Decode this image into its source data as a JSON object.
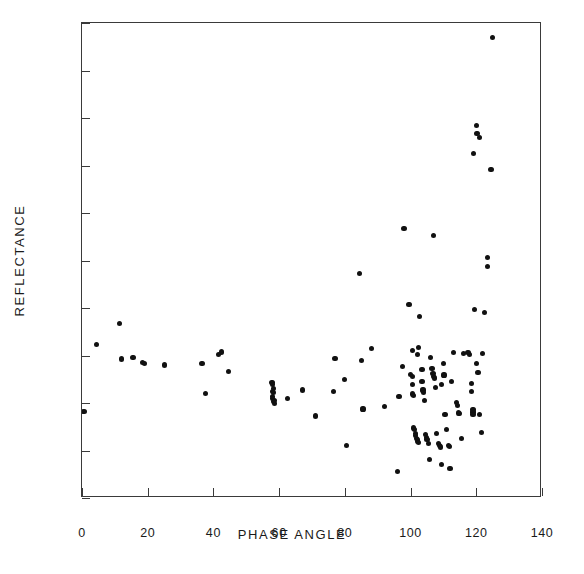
{
  "figure": {
    "background_color": "#ffffff",
    "frame_color": "#3a3a3a",
    "point_color": "#111111"
  },
  "chart_data": {
    "type": "scatter",
    "title": "",
    "xlabel": "PHASE ANGLE",
    "ylabel": "REFLECTANCE",
    "xlim": [
      0,
      140
    ],
    "ylim": [
      0,
      0.2
    ],
    "xticks": [
      0,
      20,
      40,
      60,
      80,
      100,
      120,
      140
    ],
    "xtick_labels": [
      "0",
      "20",
      "40",
      "60",
      "80",
      "100",
      "120",
      "140"
    ],
    "yticks": [
      0,
      0.02,
      0.04,
      0.06,
      0.08,
      0.1,
      0.12,
      0.14,
      0.16,
      0.18,
      0.2
    ],
    "ytick_labels": [
      "0",
      "0.02",
      "0.04",
      "0.06",
      "0.08",
      "0.10",
      "0.12",
      "0.14",
      "0.16",
      "0.18",
      "0.20"
    ],
    "grid": false,
    "legend": null,
    "marker": "filled-circle",
    "series": [
      {
        "name": "observations",
        "points": [
          [
            0.6,
            0.0365
          ],
          [
            4.5,
            0.0645
          ],
          [
            11.5,
            0.0735
          ],
          [
            12.0,
            0.0585
          ],
          [
            15.5,
            0.059
          ],
          [
            18.5,
            0.057
          ],
          [
            19.0,
            0.0565
          ],
          [
            25.0,
            0.056
          ],
          [
            36.5,
            0.0565
          ],
          [
            37.5,
            0.044
          ],
          [
            41.5,
            0.0605
          ],
          [
            42.5,
            0.0615
          ],
          [
            44.5,
            0.0532
          ],
          [
            57.8,
            0.0488
          ],
          [
            58.0,
            0.0478
          ],
          [
            58.3,
            0.0462
          ],
          [
            58.0,
            0.045
          ],
          [
            58.4,
            0.0445
          ],
          [
            58.1,
            0.0428
          ],
          [
            57.9,
            0.0418
          ],
          [
            58.2,
            0.0408
          ],
          [
            58.5,
            0.0398
          ],
          [
            58.6,
            0.041
          ],
          [
            62.5,
            0.0418
          ],
          [
            67.0,
            0.0455
          ],
          [
            71.0,
            0.0345
          ],
          [
            76.5,
            0.045
          ],
          [
            77.0,
            0.0588
          ],
          [
            80.0,
            0.05
          ],
          [
            80.5,
            0.022
          ],
          [
            84.5,
            0.0945
          ],
          [
            85.0,
            0.0578
          ],
          [
            85.5,
            0.0375
          ],
          [
            88.0,
            0.063
          ],
          [
            92.0,
            0.0385
          ],
          [
            96.0,
            0.0112
          ],
          [
            96.5,
            0.0428
          ],
          [
            97.5,
            0.0555
          ],
          [
            98.0,
            0.1135
          ],
          [
            99.5,
            0.0815
          ],
          [
            100.5,
            0.062
          ],
          [
            100.0,
            0.052
          ],
          [
            100.5,
            0.051
          ],
          [
            100.5,
            0.0478
          ],
          [
            100.7,
            0.0438
          ],
          [
            101.0,
            0.043
          ],
          [
            101.0,
            0.0295
          ],
          [
            101.2,
            0.0288
          ],
          [
            101.5,
            0.0272
          ],
          [
            101.5,
            0.0262
          ],
          [
            101.8,
            0.025
          ],
          [
            102.0,
            0.0246
          ],
          [
            102.2,
            0.0238
          ],
          [
            102.5,
            0.0232
          ],
          [
            102.0,
            0.0605
          ],
          [
            102.5,
            0.0635
          ],
          [
            102.8,
            0.0765
          ],
          [
            103.5,
            0.054
          ],
          [
            103.5,
            0.0492
          ],
          [
            103.8,
            0.0455
          ],
          [
            104.0,
            0.0445
          ],
          [
            104.2,
            0.0412
          ],
          [
            104.5,
            0.0268
          ],
          [
            104.8,
            0.0255
          ],
          [
            105.0,
            0.0245
          ],
          [
            105.5,
            0.0228
          ],
          [
            105.8,
            0.0162
          ],
          [
            106.0,
            0.0592
          ],
          [
            106.5,
            0.0545
          ],
          [
            106.8,
            0.0525
          ],
          [
            107.0,
            0.0512
          ],
          [
            107.2,
            0.0505
          ],
          [
            107.5,
            0.0465
          ],
          [
            107.0,
            0.1105
          ],
          [
            108.0,
            0.0272
          ],
          [
            108.5,
            0.023
          ],
          [
            108.8,
            0.0222
          ],
          [
            109.0,
            0.0215
          ],
          [
            109.5,
            0.014
          ],
          [
            109.5,
            0.0478
          ],
          [
            110.0,
            0.0565
          ],
          [
            110.2,
            0.0518
          ],
          [
            110.5,
            0.035
          ],
          [
            111.0,
            0.0288
          ],
          [
            111.5,
            0.0222
          ],
          [
            111.8,
            0.0218
          ],
          [
            112.0,
            0.0125
          ],
          [
            112.5,
            0.049
          ],
          [
            113.0,
            0.0612
          ],
          [
            114.0,
            0.0402
          ],
          [
            114.2,
            0.039
          ],
          [
            114.5,
            0.0358
          ],
          [
            115.0,
            0.0355
          ],
          [
            115.5,
            0.0252
          ],
          [
            116.0,
            0.0608
          ],
          [
            117.5,
            0.0612
          ],
          [
            118.0,
            0.0605
          ],
          [
            118.5,
            0.0482
          ],
          [
            118.5,
            0.045
          ],
          [
            119.0,
            0.0372
          ],
          [
            119.0,
            0.0362
          ],
          [
            119.0,
            0.0352
          ],
          [
            119.2,
            0.145
          ],
          [
            119.5,
            0.0795
          ],
          [
            120.0,
            0.1568
          ],
          [
            120.0,
            0.0565
          ],
          [
            120.2,
            0.1535
          ],
          [
            120.5,
            0.0528
          ],
          [
            121.0,
            0.1518
          ],
          [
            121.0,
            0.0352
          ],
          [
            121.5,
            0.0275
          ],
          [
            122.0,
            0.0608
          ],
          [
            122.5,
            0.0782
          ],
          [
            123.5,
            0.1012
          ],
          [
            123.5,
            0.0975
          ],
          [
            124.5,
            0.1382
          ],
          [
            125.0,
            0.1938
          ]
        ]
      }
    ]
  }
}
